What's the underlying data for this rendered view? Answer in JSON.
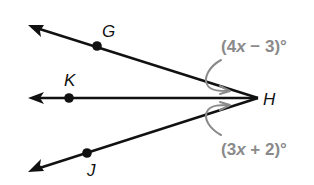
{
  "diagram": {
    "vertex": {
      "label": "H",
      "x": 258,
      "y": 98
    },
    "rays": [
      {
        "name": "ray-HG",
        "point_label": "G",
        "point": [
          97,
          46
        ],
        "tip": [
          29,
          25
        ],
        "label_pos": [
          102,
          37
        ]
      },
      {
        "name": "ray-HK",
        "point_label": "K",
        "point": [
          69,
          98
        ],
        "tip": [
          29,
          98
        ],
        "label_pos": [
          64,
          86
        ]
      },
      {
        "name": "ray-HJ",
        "point_label": "J",
        "point": [
          87,
          153
        ],
        "tip": [
          29,
          172
        ],
        "label_pos": [
          87,
          176
        ]
      }
    ],
    "angles": [
      {
        "name": "angle-GHK",
        "open": "(4",
        "var": "x",
        "close": " − 3)°",
        "expression": "(4x − 3)°"
      },
      {
        "name": "angle-KHJ",
        "open": "(3",
        "var": "x",
        "close": " + 2)°",
        "expression": "(3x + 2)°"
      }
    ],
    "colors": {
      "line": "#111111",
      "annotation": "#8a8a8a",
      "background": "#ffffff"
    }
  }
}
